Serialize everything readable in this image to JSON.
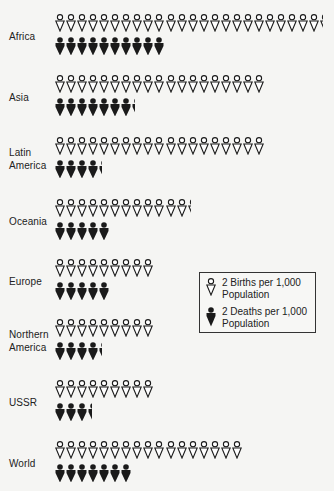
{
  "chart_data": {
    "type": "pictograph",
    "title": "",
    "unit_births": "2 Births per 1,000 Population",
    "unit_deaths": "2 Deaths per 1,000 Population",
    "categories": [
      "Africa",
      "Asia",
      "Latin America",
      "Oceania",
      "Europe",
      "Northern America",
      "USSR",
      "World"
    ],
    "series": [
      {
        "name": "Births per 1,000 Population",
        "icon_counts": [
          24.3,
          19,
          19,
          12.3,
          9,
          9,
          9,
          17
        ],
        "values": [
          48.6,
          38,
          38,
          24.6,
          18,
          18,
          18,
          34
        ]
      },
      {
        "name": "Deaths per 1,000 Population",
        "icon_counts": [
          10,
          7.3,
          4.3,
          5,
          5,
          4.3,
          3.4,
          7
        ],
        "values": [
          20,
          14.6,
          8.6,
          10,
          10,
          8.6,
          6.8,
          14
        ]
      }
    ],
    "legend": [
      "2 Births per 1,000 Population",
      "2 Deaths per 1,000 Population"
    ],
    "legend_position": "right-middle"
  },
  "rows": [
    {
      "label_lines": [
        "Africa"
      ],
      "top": 14,
      "births": 24.3,
      "deaths": 10
    },
    {
      "label_lines": [
        "Asia"
      ],
      "top": 75,
      "births": 19,
      "deaths": 7.3
    },
    {
      "label_lines": [
        "Latin",
        "America"
      ],
      "top": 137,
      "births": 19,
      "deaths": 4.3
    },
    {
      "label_lines": [
        "Oceania"
      ],
      "top": 199,
      "births": 12.3,
      "deaths": 5
    },
    {
      "label_lines": [
        "Europe"
      ],
      "top": 259,
      "births": 9,
      "deaths": 5
    },
    {
      "label_lines": [
        "Northern",
        "America"
      ],
      "top": 319,
      "births": 9,
      "deaths": 4.3
    },
    {
      "label_lines": [
        "USSR"
      ],
      "top": 380,
      "births": 9,
      "deaths": 3.4
    },
    {
      "label_lines": [
        "World"
      ],
      "top": 441,
      "births": 17,
      "deaths": 7
    }
  ],
  "legend": {
    "births_line1": "2 Births per 1,000",
    "births_line2": "Population",
    "deaths_line1": "2 Deaths per 1,000",
    "deaths_line2": "Population"
  },
  "colors": {
    "ink": "#1a1a1a",
    "background": "#f5f5f3",
    "birth_fill": "#ffffff"
  }
}
